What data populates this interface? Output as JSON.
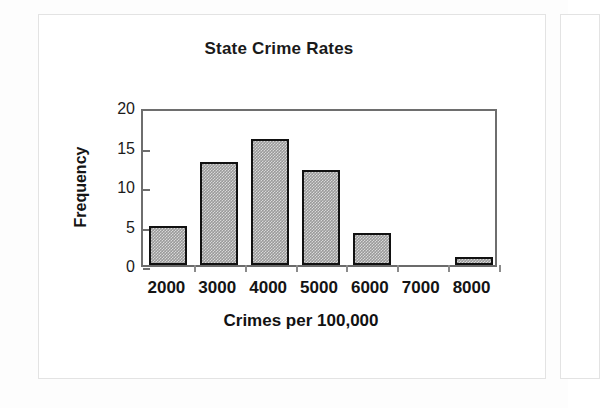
{
  "chart_data": {
    "type": "bar",
    "title": "State Crime Rates",
    "xlabel": "Crimes per 100,000",
    "ylabel": "Frequency",
    "categories": [
      "2000",
      "3000",
      "4000",
      "5000",
      "6000",
      "7000",
      "8000"
    ],
    "values": [
      5,
      13,
      16,
      12,
      4,
      0,
      1
    ],
    "x_tick_labels": [
      "2000",
      "3000",
      "4000",
      "5000",
      "6000",
      "7000",
      "8000"
    ],
    "y_tick_labels": [
      "0",
      "5",
      "10",
      "15",
      "20"
    ],
    "y_ticks": [
      0,
      5,
      10,
      15,
      20
    ],
    "ylim": [
      0,
      20
    ],
    "grid": false,
    "legend": null,
    "bar_fill_color": "#9a9a9a",
    "bar_border_color": "#111111",
    "plot_border_color": "#6e6e6e",
    "background_color": "#ffffff"
  },
  "figure": {
    "title": "State Crime Rates",
    "y_axis_title": "Frequency",
    "x_axis_title": "Crimes per 100,000"
  }
}
